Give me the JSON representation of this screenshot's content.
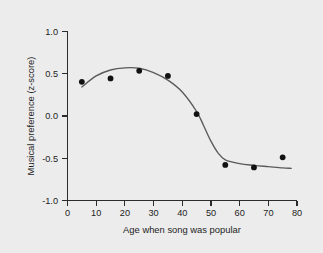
{
  "figure": {
    "background_color": "#ececec",
    "plot_background_color": "#ececec",
    "axis_color": "#2b2b2b",
    "curve_color": "#5a5a5a",
    "point_color": "#111111"
  },
  "chart_data": {
    "type": "scatter",
    "title": "",
    "subtitle": "",
    "xlabel": "Age when song was popular",
    "ylabel": "Musical preference (z-score)",
    "xlim": [
      0,
      80
    ],
    "ylim": [
      -1.0,
      1.0
    ],
    "xticks": [
      0,
      10,
      20,
      30,
      40,
      50,
      60,
      70,
      80
    ],
    "xtick_labels": [
      "0",
      "10",
      "20",
      "30",
      "40",
      "50",
      "60",
      "70",
      "80"
    ],
    "yticks": [
      1.0,
      0.5,
      0.0,
      -0.5,
      -1.0
    ],
    "ytick_labels": [
      "1.0",
      "0.5",
      "0.0",
      "-0.5",
      "-1.0"
    ],
    "grid": false,
    "legend": false,
    "legend_position": "none",
    "x": [
      5,
      15,
      25,
      35,
      45,
      55,
      65,
      75
    ],
    "y": [
      0.4,
      0.44,
      0.53,
      0.47,
      0.02,
      -0.58,
      -0.61,
      -0.49
    ],
    "series": [
      {
        "name": "Observed mean preference",
        "type": "scatter",
        "x": [
          5,
          15,
          25,
          35,
          45,
          55,
          65,
          75
        ],
        "values": [
          0.4,
          0.44,
          0.53,
          0.47,
          0.02,
          -0.58,
          -0.61,
          -0.49
        ]
      },
      {
        "name": "Fitted curve",
        "type": "line",
        "x": [
          5,
          10,
          15,
          20,
          25,
          30,
          35,
          40,
          45,
          47.5,
          50,
          52.5,
          55,
          60,
          65,
          70,
          75,
          78
        ],
        "values": [
          0.34,
          0.47,
          0.54,
          0.565,
          0.56,
          0.51,
          0.42,
          0.28,
          0.05,
          -0.12,
          -0.3,
          -0.44,
          -0.52,
          -0.565,
          -0.585,
          -0.6,
          -0.615,
          -0.62
        ]
      }
    ],
    "annotations": []
  }
}
